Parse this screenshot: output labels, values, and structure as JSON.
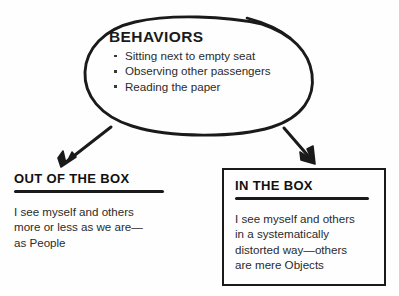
{
  "diagram": {
    "background_color": "#fefefe",
    "ink_color": "#1a1a1a"
  },
  "behaviors": {
    "title": "BEHAVIORS",
    "shape": "hand-drawn-oval",
    "bullets": [
      "Sitting next to empty seat",
      "Observing other passengers",
      "Reading the paper"
    ]
  },
  "arrows": [
    {
      "name": "arrow-to-out-of-the-box",
      "direction": "down-left"
    },
    {
      "name": "arrow-to-in-the-box",
      "direction": "down-right"
    }
  ],
  "out_of_the_box": {
    "heading": "OUT OF THE BOX",
    "lines": [
      "I see myself and others",
      "more or less as we are—",
      "as People"
    ]
  },
  "in_the_box": {
    "heading": "IN THE BOX",
    "lines": [
      "I see myself and others",
      "in a systematically",
      "distorted way—others",
      "are mere Objects"
    ]
  }
}
